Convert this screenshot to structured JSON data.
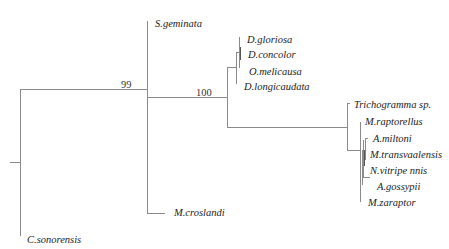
{
  "tree": {
    "type": "phylogenetic-tree",
    "bootstrap": {
      "node_99": "99",
      "node_100": "100"
    },
    "taxa": {
      "s_geminata": "S.geminata",
      "d_gloriosa": "D.gloriosa",
      "d_concolor": "D.concolor",
      "o_melicausa": "O.melicausa",
      "d_longicaudata": "D.longicaudata",
      "trichogramma": "Trichogramma sp.",
      "m_raptorellus": "M.raptorellus",
      "a_miltoni": "A.miltoni",
      "m_transvaalensis": "M.transvaalensis",
      "n_vitripennis": "N.vitripe nnis",
      "a_gossypii": "A.gossypii",
      "m_zaraptor": "M.zaraptor",
      "m_croslandi": "M.croslandi",
      "c_sonorensis": "C.sonorensis"
    },
    "colors": {
      "branch": "#8a8a8a",
      "text": "#222222"
    }
  }
}
